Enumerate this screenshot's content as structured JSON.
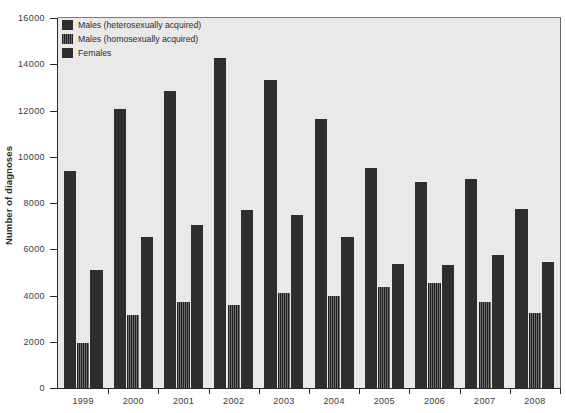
{
  "chart": {
    "type": "bar",
    "ylabel": "Number of diagnoses",
    "xlabel": "",
    "title": "",
    "background_color": "#e9e9e9",
    "legend_position": "top-left",
    "grid": false
  },
  "legend": {
    "items": [
      {
        "label": "Males (heterosexually acquired)",
        "swatch": "solid-dark",
        "color": "#2e2e2e"
      },
      {
        "label": "Males (homosexually acquired)",
        "swatch": "vertical-hatch",
        "color": "#3a3a3a"
      },
      {
        "label": "Females",
        "swatch": "solid-dark",
        "color": "#2e2e2e"
      }
    ]
  },
  "y_axis": {
    "min": 0,
    "max": 16000,
    "step": 2000,
    "ticks": [
      "0",
      "2000",
      "4000",
      "6000",
      "8000",
      "10000",
      "12000",
      "14000",
      "16000"
    ],
    "tick_values": [
      0,
      2000,
      4000,
      6000,
      8000,
      10000,
      12000,
      14000,
      16000
    ]
  },
  "x_axis": {
    "ticks": [
      "1999",
      "2000",
      "2001",
      "2002",
      "2003",
      "2004",
      "2005",
      "2006",
      "2007",
      "2008"
    ]
  },
  "chart_data": {
    "type": "bar",
    "title": "",
    "xlabel": "",
    "ylabel": "Number of diagnoses",
    "ylim": [
      0,
      16000
    ],
    "grid": false,
    "legend_position": "top-left",
    "categories": [
      "1999",
      "2000",
      "2001",
      "2002",
      "2003",
      "2004",
      "2005",
      "2006",
      "2007",
      "2008"
    ],
    "series": [
      {
        "name": "Males (heterosexually acquired)",
        "values": [
          9400,
          12050,
          12850,
          14250,
          13300,
          11650,
          9500,
          8900,
          9050,
          7750
        ]
      },
      {
        "name": "Males (homosexually acquired)",
        "values": [
          1950,
          3150,
          3700,
          3600,
          4100,
          4000,
          4350,
          4550,
          3700,
          3250
        ]
      },
      {
        "name": "Females",
        "values": [
          5100,
          6550,
          7050,
          7700,
          7500,
          6550,
          5350,
          5300,
          5750,
          5450
        ]
      }
    ]
  }
}
